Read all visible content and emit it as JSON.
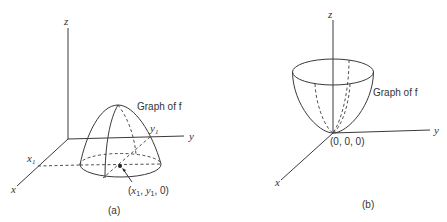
{
  "figure": {
    "panel_a": {
      "caption": "(a)",
      "axes": {
        "z": "z",
        "y": "y",
        "x": "x"
      },
      "marks": {
        "x1": "x",
        "x1_sub": "1",
        "y1": "y",
        "y1_sub": "1"
      },
      "surface_label": "Graph of f",
      "point_label": {
        "open": "(",
        "x": "x",
        "x_sub": "1",
        "sep1": ", ",
        "y": "y",
        "y_sub": "1",
        "rest": ", 0)"
      },
      "surface_shape": "dome (inverted paraboloid) above disk centered at (x1, y1, 0)"
    },
    "panel_b": {
      "caption": "(b)",
      "axes": {
        "z": "z",
        "y": "y",
        "x": "x"
      },
      "surface_label": "Graph of f",
      "point_label": "(0, 0, 0)",
      "surface_shape": "bowl (paraboloid) with vertex at origin"
    },
    "colors": {
      "ink": "#3a3a3a",
      "background": "#ffffff"
    }
  }
}
